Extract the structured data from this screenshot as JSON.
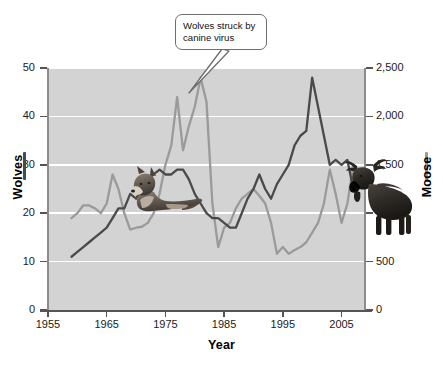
{
  "chart_data": {
    "type": "line",
    "title": "",
    "xlabel": "Year",
    "ylabel": "Wolves",
    "ylabel_right": "Moose",
    "xlim": [
      1955,
      2009
    ],
    "ylim": [
      0,
      50
    ],
    "ylim_right": [
      0,
      2500
    ],
    "grid": true,
    "legend_position": "axis-titles",
    "background_color": "#d3d3d3",
    "gridline_color": "#ffffff",
    "x_ticks": [
      "1955",
      "1965",
      "1975",
      "1985",
      "1995",
      "2005"
    ],
    "x_tick_values": [
      1955,
      1965,
      1975,
      1985,
      1995,
      2005
    ],
    "y_ticks_left": [
      "0",
      "10",
      "20",
      "30",
      "40",
      "50"
    ],
    "y_tick_values_left": [
      0,
      10,
      20,
      30,
      40,
      50
    ],
    "y_ticks_right": [
      "0",
      "500",
      "1,000",
      "1,500",
      "2,000",
      "2,500"
    ],
    "y_tick_values_right": [
      0,
      500,
      1000,
      1500,
      2000,
      2500
    ],
    "x": [
      1959,
      1960,
      1961,
      1962,
      1963,
      1964,
      1965,
      1966,
      1967,
      1968,
      1969,
      1970,
      1971,
      1972,
      1973,
      1974,
      1975,
      1976,
      1977,
      1978,
      1979,
      1980,
      1981,
      1982,
      1983,
      1984,
      1985,
      1986,
      1987,
      1988,
      1989,
      1990,
      1991,
      1992,
      1993,
      1994,
      1995,
      1996,
      1997,
      1998,
      1999,
      2000,
      2001,
      2002,
      2003,
      2004,
      2005,
      2006,
      2007,
      2008
    ],
    "series": [
      {
        "name": "Wolves",
        "axis": "left",
        "color": "#4a4a4a",
        "units": "wolves",
        "values": [
          11,
          12,
          13,
          14,
          15,
          16,
          17,
          19,
          21,
          21,
          24,
          23,
          25,
          27,
          28,
          29,
          28,
          28,
          29,
          29,
          27,
          24,
          22,
          20,
          19,
          19,
          18,
          17,
          17,
          20,
          23,
          25,
          28,
          25,
          23,
          26,
          28,
          30,
          34,
          36,
          37,
          48,
          42,
          36,
          30,
          31,
          30,
          31,
          25,
          24
        ]
      },
      {
        "name": "Moose",
        "axis": "right",
        "color": "#9a9a9a",
        "units": "moose",
        "values": [
          950,
          1000,
          1080,
          1080,
          1050,
          1000,
          1100,
          1400,
          1250,
          1000,
          830,
          850,
          860,
          900,
          1000,
          1200,
          1500,
          1700,
          2200,
          1650,
          1900,
          2100,
          2400,
          2150,
          1100,
          650,
          850,
          900,
          1050,
          1150,
          1200,
          1250,
          1180,
          1100,
          900,
          580,
          650,
          580,
          620,
          650,
          700,
          800,
          900,
          1100,
          1450,
          1200,
          900,
          1100,
          1500,
          1450
        ]
      }
    ],
    "annotations": [
      {
        "text_line_1": "Wolves struck by",
        "text_line_2": "canine virus",
        "points_at_x": 1980,
        "points_at_series": "Wolves"
      }
    ],
    "images": [
      {
        "name": "wolf-photo",
        "subject": "wolf"
      },
      {
        "name": "moose-photo",
        "subject": "moose"
      }
    ]
  },
  "figure": {
    "xlabel": "Year",
    "ylabel_left": "Wolves",
    "ylabel_right": "Moose"
  },
  "callout": {
    "line1": "Wolves struck by",
    "line2": "canine virus"
  }
}
